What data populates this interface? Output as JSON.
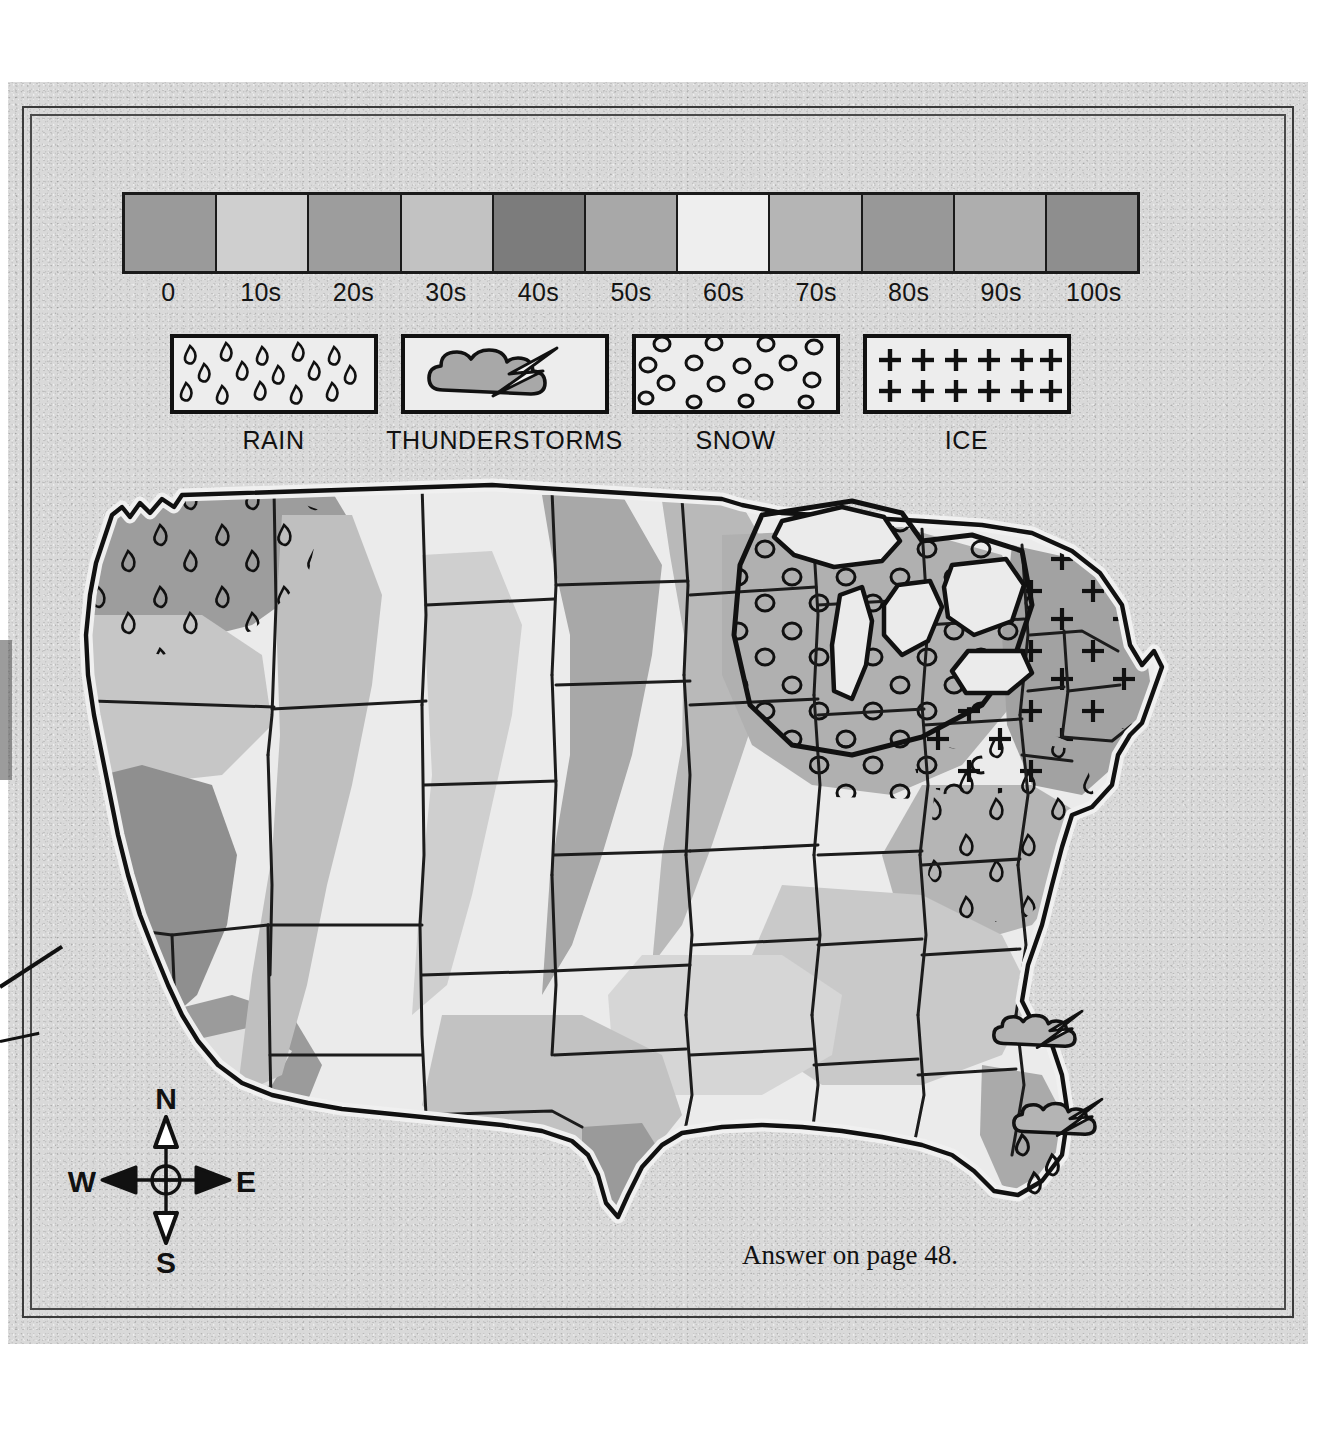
{
  "scale": {
    "title_implicit": "temperature scale",
    "ticks": [
      "0",
      "10s",
      "20s",
      "30s",
      "40s",
      "50s",
      "60s",
      "70s",
      "80s",
      "90s",
      "100s"
    ],
    "swatch_colors": [
      "#9a9a9a",
      "#cfcfcf",
      "#9d9d9d",
      "#c2c2c2",
      "#7c7c7c",
      "#a8a8a8",
      "#eeeeee",
      "#b5b5b5",
      "#989898",
      "#aeaeae",
      "#6f6f6f"
    ],
    "last_swatch_pattern": "horizontal-hatch"
  },
  "pattern_legend": {
    "items": [
      {
        "label": "RAIN",
        "icon": "rain-drops-icon"
      },
      {
        "label": "THUNDERSTORMS",
        "icon": "thunderstorm-cloud-icon"
      },
      {
        "label": "SNOW",
        "icon": "snow-circles-icon"
      },
      {
        "label": "ICE",
        "icon": "ice-plus-icon"
      }
    ]
  },
  "compass": {
    "north": "N",
    "south": "S",
    "east": "E",
    "west": "W"
  },
  "footer": {
    "text": "Answer on page 48."
  },
  "map": {
    "title_implicit": "United States weather and temperature map",
    "regions": [
      {
        "name": "Pacific Northwest",
        "weather": "RAIN",
        "band": "40s"
      },
      {
        "name": "California / Nevada",
        "weather": "none",
        "band": "40s"
      },
      {
        "name": "Northern Plains",
        "weather": "none",
        "band": "20s"
      },
      {
        "name": "Great Lakes",
        "weather": "SNOW",
        "band": "20s"
      },
      {
        "name": "Ohio Valley",
        "weather": "ICE",
        "band": "30s"
      },
      {
        "name": "New England",
        "weather": "ICE",
        "band": "20s"
      },
      {
        "name": "Mid-Atlantic",
        "weather": "RAIN",
        "band": "30s"
      },
      {
        "name": "South Texas",
        "weather": "none",
        "band": "80s"
      },
      {
        "name": "Florida / Southeast coast",
        "weather": "THUNDERSTORMS",
        "band": "80s"
      }
    ]
  },
  "colors": {
    "paper": "#d9d9d9",
    "ink": "#111111",
    "frame": "#3a3a3a",
    "land_light": "#e6e6e6",
    "band_a": "#d2d2d2",
    "band_b": "#bdbdbd",
    "band_c": "#a6a6a6",
    "band_d": "#8f8f8f"
  }
}
